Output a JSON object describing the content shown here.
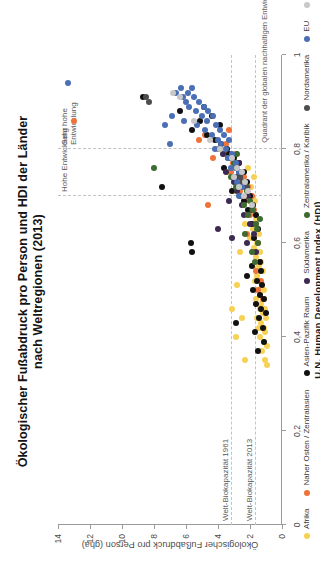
{
  "title": {
    "line1": "Ökologischer Fußabdruck pro Person und HDI der Länder",
    "line2": "nach Weltregionen (2013)"
  },
  "axes": {
    "x": {
      "label": "U.N. Human Development Index (HDI)",
      "min": 0,
      "max": 1,
      "ticks": [
        0,
        0.2,
        0.4,
        0.6,
        0.8,
        1
      ],
      "ticklabels": [
        "0",
        "0,2",
        "0,4",
        "0,6",
        "0,8",
        "1"
      ]
    },
    "y": {
      "label": "Ökologischer Fußabdruck pro Person (gha)",
      "min": 0,
      "max": 14,
      "ticks": [
        0,
        2,
        4,
        6,
        8,
        10,
        12,
        14
      ],
      "ticklabels": [
        "0",
        "2",
        "4",
        "6",
        "8",
        "10",
        "12",
        "14"
      ]
    }
  },
  "reference_lines": {
    "horizontal": [
      {
        "label": "Welt-Biokapazität 1961",
        "value": 3.2
      },
      {
        "label": "Welt-Biokapazität 2013",
        "value": 1.7
      }
    ],
    "vertical": [
      {
        "label": "Hohe Entwicklung",
        "value": 0.7
      },
      {
        "label": "Sehr hohe Entwicklung",
        "value": 0.8
      }
    ]
  },
  "annotations": {
    "quadrant": "Quadrant der globalen nachhaltigen Entwicklung",
    "region_high": "Hohe\nEntwicklung",
    "region_veryhigh": "Sehr hohe\nEntwicklung"
  },
  "legend": [
    {
      "label": "Afrika",
      "color": "#f7d154"
    },
    {
      "label": "Naher Osten / Zentralasien",
      "color": "#ef7339"
    },
    {
      "label": "Asien-Pazifik Raum",
      "color": "#111111"
    },
    {
      "label": "Südamerika",
      "color": "#3c2a52"
    },
    {
      "label": "Zentralamerika / Karibik",
      "color": "#3f6b33"
    },
    {
      "label": "Nordamerika",
      "color": "#4d4d4d"
    },
    {
      "label": "EU",
      "color": "#4a6fb5"
    },
    {
      "label": "andere europäische Länder",
      "color": "#c8c8c8"
    }
  ],
  "chart_data": {
    "type": "scatter",
    "title": "Ökologischer Fußabdruck pro Person und HDI der Länder nach Weltregionen (2013)",
    "xlabel": "U.N. Human Development Index (HDI)",
    "ylabel": "Ökologischer Fußabdruck pro Person (gha)",
    "xlim": [
      0,
      1
    ],
    "ylim": [
      0,
      14
    ],
    "grid": false,
    "legend_position": "below-left",
    "series": [
      {
        "name": "Afrika",
        "color": "#f7d154",
        "points": [
          [
            0.34,
            0.95
          ],
          [
            0.35,
            1.05
          ],
          [
            0.37,
            1.25
          ],
          [
            0.38,
            0.95
          ],
          [
            0.39,
            1.15
          ],
          [
            0.4,
            1.35
          ],
          [
            0.41,
            1.05
          ],
          [
            0.42,
            1.45
          ],
          [
            0.42,
            1.1
          ],
          [
            0.43,
            1.3
          ],
          [
            0.44,
            1.0
          ],
          [
            0.44,
            1.55
          ],
          [
            0.45,
            1.2
          ],
          [
            0.46,
            1.4
          ],
          [
            0.46,
            1.05
          ],
          [
            0.47,
            1.3
          ],
          [
            0.48,
            1.6
          ],
          [
            0.48,
            1.15
          ],
          [
            0.49,
            1.35
          ],
          [
            0.5,
            1.5
          ],
          [
            0.5,
            1.1
          ],
          [
            0.51,
            1.25
          ],
          [
            0.52,
            1.7
          ],
          [
            0.52,
            1.35
          ],
          [
            0.53,
            1.55
          ],
          [
            0.54,
            1.2
          ],
          [
            0.55,
            1.45
          ],
          [
            0.55,
            1.85
          ],
          [
            0.56,
            1.3
          ],
          [
            0.57,
            1.6
          ],
          [
            0.58,
            2.6
          ],
          [
            0.58,
            1.4
          ],
          [
            0.59,
            1.75
          ],
          [
            0.6,
            1.55
          ],
          [
            0.61,
            2.0
          ],
          [
            0.62,
            1.45
          ],
          [
            0.63,
            1.8
          ],
          [
            0.64,
            2.3
          ],
          [
            0.65,
            1.6
          ],
          [
            0.66,
            2.1
          ],
          [
            0.4,
            2.9
          ],
          [
            0.44,
            2.5
          ],
          [
            0.46,
            3.1
          ],
          [
            0.51,
            2.8
          ],
          [
            0.35,
            2.3
          ],
          [
            0.67,
            1.9
          ],
          [
            0.68,
            2.4
          ],
          [
            0.69,
            1.7
          ],
          [
            0.7,
            2.2
          ],
          [
            0.71,
            3.0
          ],
          [
            0.72,
            1.95
          ],
          [
            0.73,
            2.6
          ],
          [
            0.74,
            1.75
          ],
          [
            0.75,
            3.4
          ],
          [
            0.76,
            2.1
          ]
        ]
      },
      {
        "name": "Naher Osten / Zentralasien",
        "color": "#ef7339",
        "points": [
          [
            0.86,
            13.0
          ],
          [
            0.8,
            4.0
          ],
          [
            0.79,
            3.6
          ],
          [
            0.78,
            4.3
          ],
          [
            0.82,
            5.2
          ],
          [
            0.68,
            4.6
          ],
          [
            0.76,
            2.8
          ],
          [
            0.75,
            3.2
          ],
          [
            0.74,
            2.4
          ],
          [
            0.73,
            2.9
          ],
          [
            0.72,
            2.1
          ],
          [
            0.71,
            2.6
          ],
          [
            0.7,
            1.9
          ],
          [
            0.69,
            2.3
          ],
          [
            0.67,
            1.75
          ],
          [
            0.66,
            2.0
          ],
          [
            0.64,
            1.6
          ],
          [
            0.62,
            2.2
          ],
          [
            0.6,
            1.5
          ],
          [
            0.58,
            1.8
          ],
          [
            0.56,
            1.35
          ],
          [
            0.54,
            1.6
          ],
          [
            0.52,
            1.3
          ],
          [
            0.5,
            1.5
          ],
          [
            0.48,
            1.2
          ],
          [
            0.77,
            3.05
          ],
          [
            0.79,
            2.9
          ],
          [
            0.83,
            4.8
          ],
          [
            0.84,
            3.3
          ],
          [
            0.81,
            3.5
          ]
        ]
      },
      {
        "name": "Asien-Pazifik Raum",
        "color": "#111111",
        "points": [
          [
            0.91,
            8.7
          ],
          [
            0.72,
            7.5
          ],
          [
            0.88,
            6.4
          ],
          [
            0.86,
            5.1
          ],
          [
            0.84,
            5.6
          ],
          [
            0.83,
            4.7
          ],
          [
            0.82,
            4.2
          ],
          [
            0.81,
            3.8
          ],
          [
            0.79,
            3.3
          ],
          [
            0.78,
            3.0
          ],
          [
            0.77,
            2.7
          ],
          [
            0.76,
            3.6
          ],
          [
            0.75,
            2.4
          ],
          [
            0.74,
            2.8
          ],
          [
            0.73,
            2.2
          ],
          [
            0.72,
            2.6
          ],
          [
            0.71,
            3.1
          ],
          [
            0.7,
            2.0
          ],
          [
            0.69,
            2.4
          ],
          [
            0.68,
            1.8
          ],
          [
            0.67,
            2.1
          ],
          [
            0.66,
            1.65
          ],
          [
            0.64,
            1.9
          ],
          [
            0.63,
            1.5
          ],
          [
            0.61,
            1.75
          ],
          [
            0.6,
            5.7
          ],
          [
            0.58,
            5.6
          ],
          [
            0.56,
            1.4
          ],
          [
            0.55,
            1.9
          ],
          [
            0.54,
            1.3
          ],
          [
            0.53,
            2.2
          ],
          [
            0.52,
            1.55
          ],
          [
            0.51,
            1.25
          ],
          [
            0.5,
            1.8
          ],
          [
            0.49,
            1.4
          ],
          [
            0.48,
            1.15
          ],
          [
            0.47,
            1.6
          ],
          [
            0.46,
            1.3
          ],
          [
            0.45,
            1.0
          ],
          [
            0.44,
            1.45
          ],
          [
            0.43,
            2.9
          ],
          [
            0.42,
            1.2
          ],
          [
            0.41,
            1.7
          ],
          [
            0.39,
            1.1
          ],
          [
            0.37,
            1.5
          ],
          [
            0.89,
            4.9
          ],
          [
            0.87,
            4.4
          ],
          [
            0.85,
            3.9
          ],
          [
            0.8,
            3.45
          ]
        ]
      },
      {
        "name": "Südamerika",
        "color": "#3c2a52",
        "points": [
          [
            0.78,
            3.2
          ],
          [
            0.76,
            2.9
          ],
          [
            0.75,
            3.5
          ],
          [
            0.74,
            2.6
          ],
          [
            0.73,
            3.0
          ],
          [
            0.72,
            2.3
          ],
          [
            0.71,
            2.8
          ],
          [
            0.7,
            2.1
          ],
          [
            0.69,
            3.3
          ],
          [
            0.68,
            2.5
          ],
          [
            0.67,
            1.9
          ],
          [
            0.66,
            2.4
          ],
          [
            0.64,
            2.0
          ],
          [
            0.62,
            1.75
          ],
          [
            0.6,
            2.2
          ],
          [
            0.58,
            1.6
          ],
          [
            0.77,
            2.7
          ],
          [
            0.79,
            3.7
          ],
          [
            0.63,
            4.0
          ],
          [
            0.61,
            3.1
          ]
        ]
      },
      {
        "name": "Zentralamerika / Karibik",
        "color": "#3f6b33",
        "points": [
          [
            0.76,
            8.0
          ],
          [
            0.8,
            3.9
          ],
          [
            0.78,
            3.4
          ],
          [
            0.77,
            3.0
          ],
          [
            0.75,
            2.7
          ],
          [
            0.74,
            3.2
          ],
          [
            0.73,
            2.4
          ],
          [
            0.72,
            2.9
          ],
          [
            0.71,
            2.2
          ],
          [
            0.7,
            2.6
          ],
          [
            0.69,
            2.0
          ],
          [
            0.68,
            2.4
          ],
          [
            0.67,
            1.8
          ],
          [
            0.66,
            2.1
          ],
          [
            0.64,
            1.65
          ],
          [
            0.62,
            2.3
          ],
          [
            0.6,
            1.5
          ],
          [
            0.58,
            1.9
          ],
          [
            0.56,
            1.7
          ],
          [
            0.79,
            2.8
          ],
          [
            0.65,
            1.35
          ],
          [
            0.63,
            1.55
          ]
        ]
      },
      {
        "name": "Nordamerika",
        "color": "#4d4d4d",
        "points": [
          [
            0.91,
            8.5
          ],
          [
            0.9,
            8.3
          ],
          [
            0.74,
            2.6
          ],
          [
            0.73,
            2.5
          ],
          [
            0.72,
            2.2
          ]
        ]
      },
      {
        "name": "EU",
        "color": "#4a6fb5",
        "points": [
          [
            0.94,
            13.4
          ],
          [
            0.92,
            6.6
          ],
          [
            0.92,
            5.9
          ],
          [
            0.91,
            6.2
          ],
          [
            0.91,
            5.5
          ],
          [
            0.9,
            6.0
          ],
          [
            0.9,
            5.2
          ],
          [
            0.89,
            5.8
          ],
          [
            0.89,
            4.9
          ],
          [
            0.88,
            5.4
          ],
          [
            0.88,
            4.6
          ],
          [
            0.87,
            5.0
          ],
          [
            0.87,
            4.3
          ],
          [
            0.86,
            6.1
          ],
          [
            0.86,
            4.7
          ],
          [
            0.85,
            5.3
          ],
          [
            0.85,
            4.1
          ],
          [
            0.84,
            4.8
          ],
          [
            0.84,
            3.9
          ],
          [
            0.83,
            4.4
          ],
          [
            0.83,
            3.6
          ],
          [
            0.82,
            4.0
          ],
          [
            0.82,
            3.3
          ],
          [
            0.81,
            3.8
          ],
          [
            0.81,
            7.0
          ],
          [
            0.8,
            3.5
          ],
          [
            0.8,
            4.2
          ],
          [
            0.79,
            3.1
          ],
          [
            0.78,
            3.4
          ],
          [
            0.77,
            2.9
          ],
          [
            0.76,
            3.2
          ],
          [
            0.75,
            2.7
          ],
          [
            0.93,
            6.3
          ],
          [
            0.93,
            5.6
          ],
          [
            0.87,
            6.9
          ],
          [
            0.85,
            7.3
          ],
          [
            0.74,
            3.0
          ],
          [
            0.73,
            2.8
          ],
          [
            0.72,
            2.5
          ],
          [
            0.7,
            2.7
          ]
        ]
      },
      {
        "name": "andere europäische Länder",
        "color": "#c8c8c8",
        "points": [
          [
            0.92,
            6.8
          ],
          [
            0.91,
            6.4
          ],
          [
            0.86,
            5.5
          ],
          [
            0.82,
            4.5
          ],
          [
            0.8,
            3.9
          ],
          [
            0.78,
            3.1
          ],
          [
            0.76,
            2.8
          ],
          [
            0.75,
            2.5
          ],
          [
            0.74,
            3.0
          ],
          [
            0.73,
            2.3
          ],
          [
            0.72,
            2.7
          ],
          [
            0.71,
            2.1
          ],
          [
            0.7,
            2.4
          ],
          [
            0.68,
            1.9
          ]
        ]
      }
    ]
  }
}
